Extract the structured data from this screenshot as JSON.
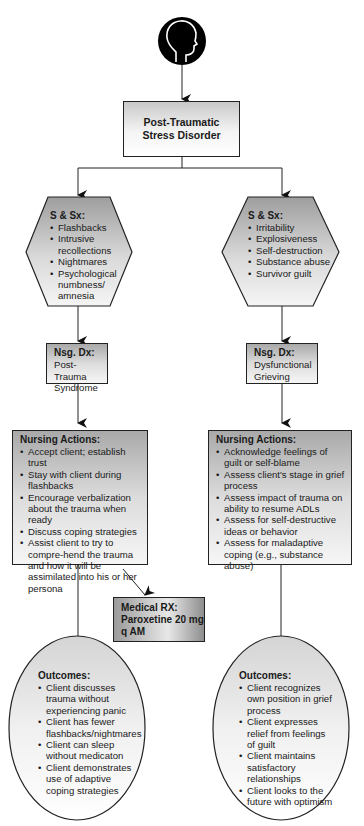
{
  "diagram": {
    "icon": "head-profile-icon",
    "root": {
      "title": "Post-Traumatic Stress Disorder"
    },
    "left": {
      "symptoms": {
        "header": "S & Sx:",
        "items": [
          "Flashbacks",
          "Intrusive recollections",
          "Nightmares",
          "Psychological numbness/ amnesia"
        ]
      },
      "nsg_dx": {
        "header": "Nsg. Dx:",
        "text": "Post-Trauma Syndrome"
      },
      "nursing_actions": {
        "header": "Nursing Actions:",
        "items": [
          "Accept client; establish trust",
          "Stay with client during flashbacks",
          "Encourage verbalization about the trauma when ready",
          "Discuss coping strategies",
          "Assist client to try to compre-hend the trauma and how it will be assimilated into his or her persona"
        ]
      },
      "medical_rx": {
        "header": "Medical RX:",
        "text": "Paroxetine 20 mg q AM"
      },
      "outcomes": {
        "header": "Outcomes:",
        "items": [
          "Client discusses trauma without experiencing panic",
          "Client has fewer flashbacks/nightmares",
          "Client can sleep without medicaton",
          "Client demonstrates use of adaptive coping strategies"
        ]
      }
    },
    "right": {
      "symptoms": {
        "header": "S & Sx:",
        "items": [
          "Irritability",
          "Explosiveness",
          "Self-destruction",
          "Substance abuse",
          "Survivor guilt"
        ]
      },
      "nsg_dx": {
        "header": "Nsg. Dx:",
        "text": "Dysfunctional Grieving"
      },
      "nursing_actions": {
        "header": "Nursing Actions:",
        "items": [
          "Acknowledge feelings of guilt or self-blame",
          "Assess client's stage in grief process",
          "Assess impact of trauma on ability to resume ADLs",
          "Assess for self-destructive ideas or behavior",
          "Assess for maladaptive coping (e.g., substance abuse)"
        ]
      },
      "outcomes": {
        "header": "Outcomes:",
        "items": [
          "Client recognizes own position in grief process",
          "Client expresses relief from feelings of guilt",
          "Client maintains satisfactory relationships",
          "Client looks to the future with optimism"
        ]
      }
    },
    "colors": {
      "line": "#222222",
      "box_gray": "#b0b0b0",
      "icon": "#000000"
    }
  }
}
